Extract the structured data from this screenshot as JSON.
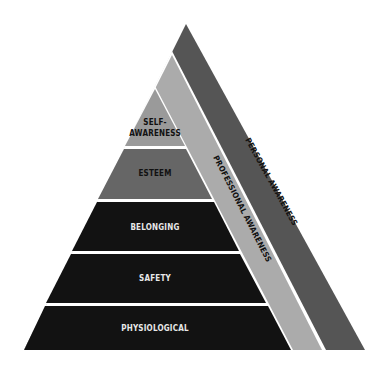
{
  "diagram": {
    "type": "pyramid",
    "levels": [
      {
        "id": "self-awareness",
        "line1": "SELF-",
        "line2": "AWARENESS",
        "color": "#9a9a9a",
        "text_color": "#111111"
      },
      {
        "id": "esteem",
        "label": "ESTEEM",
        "color": "#666666",
        "text_color": "#111111"
      },
      {
        "id": "belonging",
        "label": "BELONGING",
        "color": "#121212",
        "text_color": "#e8e8e8"
      },
      {
        "id": "safety",
        "label": "SAFETY",
        "color": "#121212",
        "text_color": "#e8e8e8"
      },
      {
        "id": "physiological",
        "label": "PHYSIOLOGICAL",
        "color": "#121212",
        "text_color": "#e8e8e8"
      }
    ],
    "side_bands": [
      {
        "id": "professional-awareness",
        "label": "PROFESSIONAL AWARENESS",
        "color": "#ababab",
        "text_color": "#111111"
      },
      {
        "id": "personal-awareness",
        "label": "PERSONAL AWARENESS",
        "color": "#555555",
        "text_color": "#111111"
      }
    ],
    "separator_color": "#ffffff"
  }
}
